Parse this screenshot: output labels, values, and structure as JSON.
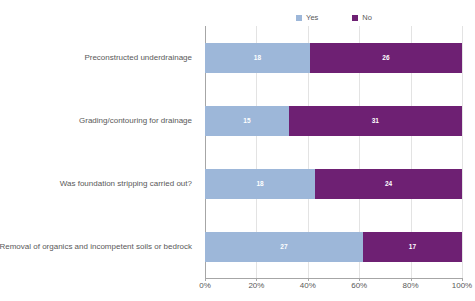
{
  "chart_data": {
    "type": "bar",
    "subtype": "stacked-horizontal-100-percent",
    "title": "",
    "xlabel": "",
    "ylabel": "",
    "xlim": [
      0,
      100
    ],
    "xticks": [
      "0%",
      "20%",
      "40%",
      "60%",
      "80%",
      "100%"
    ],
    "xtick_values": [
      0,
      20,
      40,
      60,
      80,
      100
    ],
    "grid": true,
    "legend_position": "top",
    "categories": [
      "Preconstructed underdrainage",
      "Grading/contouring for drainage",
      "Was foundation stripping carried out?",
      "Removal of organics and incompetent soils or bedrock"
    ],
    "series": [
      {
        "name": "Yes",
        "color": "#9DB7D9",
        "values": [
          18,
          15,
          18,
          27
        ],
        "percentages": [
          40.9,
          32.6,
          42.9,
          61.4
        ]
      },
      {
        "name": "No",
        "color": "#6E2073",
        "values": [
          26,
          31,
          24,
          17
        ],
        "percentages": [
          59.1,
          67.4,
          57.1,
          38.6
        ]
      }
    ],
    "totals": [
      44,
      46,
      42,
      44
    ],
    "label_color": "#FFFFFF",
    "axis_color": "#A6A6A6",
    "grid_color": "#E3E3E3",
    "text_color": "#595959",
    "background": "#FFFFFF"
  },
  "legend": {
    "items": [
      {
        "label": "Yes",
        "color": "#9DB7D9"
      },
      {
        "label": "No",
        "color": "#6E2073"
      }
    ]
  }
}
